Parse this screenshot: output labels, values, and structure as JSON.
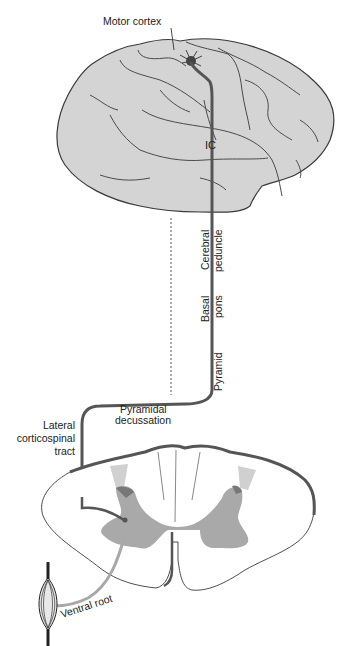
{
  "figure": {
    "colors": {
      "brain_fill": "#d4d4d4",
      "outline": "#3a3a3a",
      "tract": "#555555",
      "gray_matter": "#a9a9a9",
      "light_gray": "#cfcfcf",
      "ventral_root": "#a8a8a8",
      "background": "#ffffff"
    },
    "labels": {
      "motor_cortex": "Motor cortex",
      "internal_capsule": "IC",
      "cerebral_peduncle_1": "Cerebral",
      "cerebral_peduncle_2": "peduncle",
      "basal_pons_1": "Basal",
      "basal_pons_2": "pons",
      "pyramid": "Pyramid",
      "pyramidal_decussation_1": "Pyramidal",
      "pyramidal_decussation_2": "decussation",
      "lateral_cst_1": "Lateral",
      "lateral_cst_2": "corticospinal",
      "lateral_cst_3": "tract",
      "ventral_root": "Ventral root"
    }
  }
}
